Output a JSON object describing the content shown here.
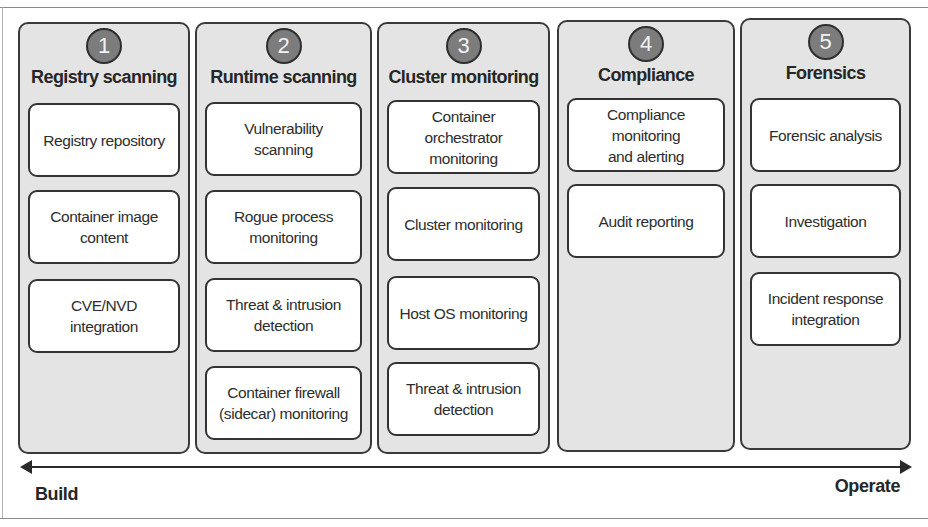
{
  "diagram": {
    "colors": {
      "column_fill": "#e4e4e4",
      "card_fill": "#ffffff",
      "border": "#333333",
      "badge_fill": "#7c7c7c",
      "badge_text": "#f2f2f2"
    },
    "columns": [
      {
        "number": "1",
        "title": "Registry scanning",
        "items": [
          "Registry repository",
          "Container image\ncontent",
          "CVE/NVD\nintegration"
        ]
      },
      {
        "number": "2",
        "title": "Runtime scanning",
        "items": [
          "Vulnerability\nscanning",
          "Rogue process\nmonitoring",
          "Threat & intrusion\ndetection",
          "Container firewall\n(sidecar) monitoring"
        ]
      },
      {
        "number": "3",
        "title": "Cluster monitoring",
        "items": [
          "Container\norchestrator\nmonitoring",
          "Cluster monitoring",
          "Host OS monitoring",
          "Threat & intrusion\ndetection"
        ]
      },
      {
        "number": "4",
        "title": "Compliance",
        "items": [
          "Compliance\nmonitoring\nand alerting",
          "Audit reporting"
        ]
      },
      {
        "number": "5",
        "title": "Forensics",
        "items": [
          "Forensic analysis",
          "Investigation",
          "Incident response\nintegration"
        ]
      }
    ],
    "axis": {
      "left_label": "Build",
      "right_label": "Operate"
    }
  }
}
